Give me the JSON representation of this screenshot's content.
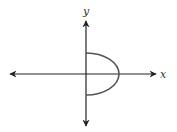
{
  "diagram": {
    "axes": {
      "x_label": "x",
      "y_label": "y"
    },
    "curve": {
      "shape": "half-ellipse",
      "side": "right",
      "y_intercepts": [
        "positive",
        "negative"
      ],
      "x_intercept": "positive"
    },
    "colors": {
      "axes": "#222222",
      "curve": "#555555",
      "background": "#ffffff"
    }
  }
}
